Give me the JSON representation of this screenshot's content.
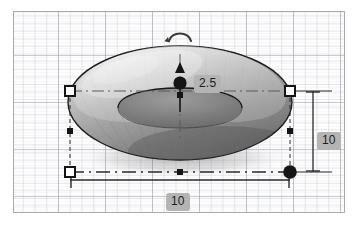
{
  "app": {
    "viewport_name": "3d-modeling-viewport",
    "background": "#fdfdfd",
    "border_color": "#a9a9ac",
    "grid": {
      "major_color": "#969baf",
      "minor_color": "#b0b6c8",
      "major_spacing_px": 47,
      "minor_spacing_px": 11.75
    }
  },
  "model": {
    "shape": "torus",
    "shading": "grayscale-smooth",
    "outline_color": "#1a1a1a",
    "highlight_color": "#e9e9e9",
    "shadow_color": "#6d6d6d"
  },
  "dimensions": [
    {
      "name": "height",
      "value": "2.5",
      "orientation": "vertical",
      "anchor": "center"
    },
    {
      "name": "depth",
      "value": "10",
      "orientation": "vertical",
      "anchor": "right"
    },
    {
      "name": "width",
      "value": "10",
      "orientation": "horizontal",
      "anchor": "bottom"
    }
  ],
  "handles": {
    "rotate": {
      "icon": "rotate-arc-icon",
      "label": ""
    },
    "arrow_up": {
      "icon": "triangle-up-icon",
      "label": ""
    },
    "center_grip": {
      "icon": "circle-filled-icon",
      "label": ""
    },
    "center_square": {
      "icon": "square-small-icon",
      "label": ""
    },
    "corner_left": {
      "icon": "square-handle-icon",
      "label": ""
    },
    "corner_right": {
      "icon": "square-handle-icon",
      "label": ""
    },
    "corner_bottom_left": {
      "icon": "square-handle-icon",
      "label": ""
    },
    "corner_bottom_right": {
      "icon": "circle-filled-icon",
      "label": ""
    },
    "edge_left": {
      "icon": "square-small-icon",
      "label": ""
    },
    "edge_right": {
      "icon": "square-small-icon",
      "label": ""
    },
    "edge_bottom": {
      "icon": "square-small-icon",
      "label": ""
    }
  }
}
